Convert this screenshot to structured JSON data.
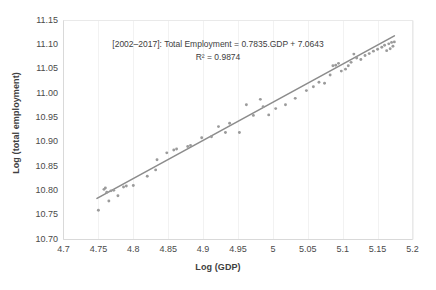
{
  "chart_data": {
    "type": "scatter",
    "title": "",
    "xlabel": "Log (GDP)",
    "ylabel": "Log (total employment)",
    "xlim": [
      4.7,
      5.2
    ],
    "ylim": [
      10.7,
      11.15
    ],
    "xticks": [
      "4.7",
      "4.75",
      "4.8",
      "4.85",
      "4.9",
      "4.95",
      "5",
      "5.05",
      "5.1",
      "5.15",
      "5.2"
    ],
    "yticks": [
      "10.70",
      "10.75",
      "10.80",
      "10.85",
      "10.90",
      "10.95",
      "11.00",
      "11.05",
      "11.10",
      "11.15"
    ],
    "grid": "vertical-only",
    "legend": "none",
    "annotation_line1": "[2002–2017]: Total Employment = 0.7835.GDP + 7.0643",
    "annotation_line2": "R² = 0.9874",
    "equation": {
      "slope": 0.7835,
      "intercept": 7.0643,
      "r_squared": 0.9874,
      "period": "2002–2017"
    },
    "marker_color": "#9b9b9b",
    "trendline_color": "#8c8c8c",
    "gridline_color": "#f2f2f2",
    "trendline": {
      "x0": 4.748,
      "y0": 10.7846,
      "x1": 5.174,
      "y1": 11.1184
    },
    "points": [
      [
        4.75,
        10.76
      ],
      [
        4.758,
        10.803
      ],
      [
        4.76,
        10.806
      ],
      [
        4.762,
        10.797
      ],
      [
        4.765,
        10.779
      ],
      [
        4.768,
        10.8
      ],
      [
        4.772,
        10.801
      ],
      [
        4.778,
        10.79
      ],
      [
        4.786,
        10.808
      ],
      [
        4.79,
        10.81
      ],
      [
        4.8,
        10.811
      ],
      [
        4.82,
        10.83
      ],
      [
        4.832,
        10.843
      ],
      [
        4.834,
        10.864
      ],
      [
        4.848,
        10.878
      ],
      [
        4.858,
        10.884
      ],
      [
        4.862,
        10.886
      ],
      [
        4.878,
        10.891
      ],
      [
        4.882,
        10.893
      ],
      [
        4.898,
        10.909
      ],
      [
        4.912,
        10.911
      ],
      [
        4.922,
        10.932
      ],
      [
        4.932,
        10.92
      ],
      [
        4.938,
        10.939
      ],
      [
        4.952,
        10.92
      ],
      [
        4.962,
        10.977
      ],
      [
        4.972,
        10.955
      ],
      [
        4.982,
        10.988
      ],
      [
        4.986,
        10.973
      ],
      [
        4.994,
        10.956
      ],
      [
        5.004,
        10.969
      ],
      [
        5.018,
        10.977
      ],
      [
        5.032,
        10.99
      ],
      [
        5.048,
        11.006
      ],
      [
        5.058,
        11.014
      ],
      [
        5.066,
        11.023
      ],
      [
        5.074,
        11.021
      ],
      [
        5.082,
        11.038
      ],
      [
        5.086,
        11.057
      ],
      [
        5.09,
        11.058
      ],
      [
        5.094,
        11.062
      ],
      [
        5.098,
        11.046
      ],
      [
        5.104,
        11.05
      ],
      [
        5.108,
        11.057
      ],
      [
        5.112,
        11.064
      ],
      [
        5.116,
        11.081
      ],
      [
        5.12,
        11.073
      ],
      [
        5.126,
        11.07
      ],
      [
        5.132,
        11.078
      ],
      [
        5.138,
        11.082
      ],
      [
        5.144,
        11.087
      ],
      [
        5.15,
        11.091
      ],
      [
        5.156,
        11.095
      ],
      [
        5.16,
        11.099
      ],
      [
        5.163,
        11.088
      ],
      [
        5.166,
        11.102
      ],
      [
        5.168,
        11.092
      ],
      [
        5.17,
        11.105
      ],
      [
        5.172,
        11.097
      ],
      [
        5.174,
        11.106
      ]
    ]
  }
}
